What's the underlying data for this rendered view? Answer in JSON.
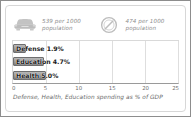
{
  "panel": {
    "stats": [
      {
        "icon": "car-icon",
        "value": "539 per 1000",
        "unit": "population"
      },
      {
        "icon": "telephone-dial-icon",
        "value": "474 per 1000",
        "unit": "population"
      }
    ],
    "caption": "Defense, Health, Education spending as % of GDP"
  },
  "chart_data": {
    "type": "bar",
    "orientation": "horizontal",
    "categories": [
      "Defense",
      "Education",
      "Health"
    ],
    "values": [
      1.9,
      4.7,
      5.0
    ],
    "labels": [
      "Defense 1.9%",
      "Education 4.7%",
      "Health 5.0%"
    ],
    "title": "",
    "subtitle": "",
    "xlabel": "Defense, Health, Education spending as % of GDP",
    "ylabel": "",
    "xlim": [
      0,
      25
    ],
    "xticks": [
      0,
      5,
      10,
      15,
      20,
      25
    ],
    "xticklabels": [
      "0",
      "5",
      "10",
      "15",
      "20",
      "25"
    ],
    "grid": "vertical",
    "legend": "none",
    "bar_color": "#9d9d9d",
    "bar_border_color": "#6e6e6e",
    "grid_color": "#dedede",
    "axis_color": "#9a9a9a",
    "text_color": "#1a1a1a"
  }
}
